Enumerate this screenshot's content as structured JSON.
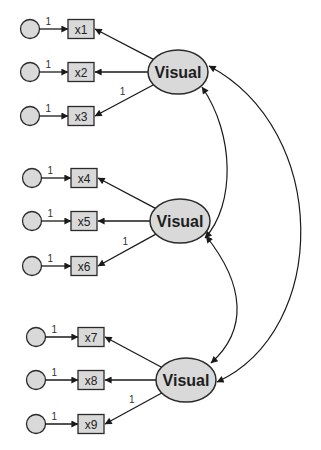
{
  "diagram": {
    "type": "SEM path diagram (confirmatory factor analysis)",
    "colors": {
      "node_fill": "#d9d9d9",
      "stroke": "#2a2a2a",
      "background": "#ffffff"
    },
    "groups": [
      {
        "latent": {
          "label": "Visual",
          "cx": 178,
          "cy": 72
        },
        "indicators": [
          {
            "label": "x1",
            "y": 29,
            "error_path": "1",
            "loading": ""
          },
          {
            "label": "x2",
            "y": 72,
            "error_path": "1",
            "loading": ""
          },
          {
            "label": "x3",
            "y": 116,
            "error_path": "1",
            "loading": "1"
          }
        ],
        "circle_x": 30,
        "box_x": 68
      },
      {
        "latent": {
          "label": "Visual",
          "cx": 180,
          "cy": 221
        },
        "indicators": [
          {
            "label": "x4",
            "y": 178,
            "error_path": "1",
            "loading": ""
          },
          {
            "label": "x5",
            "y": 221,
            "error_path": "1",
            "loading": ""
          },
          {
            "label": "x6",
            "y": 266,
            "error_path": "1",
            "loading": "1"
          }
        ],
        "circle_x": 32,
        "box_x": 71
      },
      {
        "latent": {
          "label": "Visual",
          "cx": 186,
          "cy": 380
        },
        "indicators": [
          {
            "label": "x7",
            "y": 337,
            "error_path": "1",
            "loading": ""
          },
          {
            "label": "x8",
            "y": 380,
            "error_path": "1",
            "loading": ""
          },
          {
            "label": "x9",
            "y": 424,
            "error_path": "1",
            "loading": "1"
          }
        ],
        "circle_x": 36,
        "box_x": 78
      }
    ],
    "covariances": [
      {
        "from": 0,
        "to": 1
      },
      {
        "from": 1,
        "to": 2
      },
      {
        "from": 0,
        "to": 2
      }
    ]
  }
}
